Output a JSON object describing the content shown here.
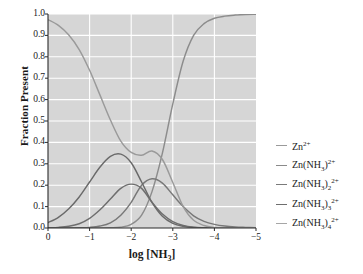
{
  "chart_data": {
    "type": "line",
    "title": "",
    "xlabel": "log [NH3]",
    "ylabel": "Fraction Present",
    "xlim": [
      0,
      -5
    ],
    "ylim": [
      0.0,
      1.0
    ],
    "grid": true,
    "legend_position": "right",
    "xticks": [
      "0",
      "−1",
      "−2",
      "−3",
      "−4",
      "−5"
    ],
    "xtick_values": [
      0,
      -1,
      -2,
      -3,
      -4,
      -5
    ],
    "yticks": [
      "0.0",
      "0.1",
      "0.2",
      "0.3",
      "0.4",
      "0.5",
      "0.6",
      "0.7",
      "0.8",
      "0.9",
      "1.0"
    ],
    "ytick_values": [
      0.0,
      0.1,
      0.2,
      0.3,
      0.4,
      0.5,
      0.6,
      0.7,
      0.8,
      0.9,
      1.0
    ],
    "x": [
      0.0,
      -0.25,
      -0.5,
      -0.75,
      -1.0,
      -1.25,
      -1.5,
      -1.75,
      -2.0,
      -2.25,
      -2.5,
      -2.75,
      -3.0,
      -3.25,
      -3.5,
      -3.75,
      -4.0,
      -4.25,
      -4.5,
      -4.75,
      -5.0
    ],
    "series": [
      {
        "name": "Zn2+",
        "label_html": "Zn<sup>2+</sup>",
        "color": "#8c8c8c",
        "values": [
          0.0,
          0.0,
          0.0,
          0.0,
          0.0,
          0.0,
          0.001,
          0.004,
          0.017,
          0.06,
          0.17,
          0.35,
          0.58,
          0.78,
          0.9,
          0.955,
          0.98,
          0.99,
          0.995,
          0.998,
          0.999
        ]
      },
      {
        "name": "Zn(NH3)2+",
        "label_html": "Zn(NH<sub>3</sub>)<sup>2+</sup>",
        "color": "#787878",
        "values": [
          0.0,
          0.0,
          0.0,
          0.001,
          0.003,
          0.009,
          0.024,
          0.06,
          0.12,
          0.2,
          0.23,
          0.21,
          0.155,
          0.1,
          0.057,
          0.031,
          0.017,
          0.009,
          0.005,
          0.003,
          0.0015
        ]
      },
      {
        "name": "Zn(NH3)2 2+",
        "label_html": "Zn(NH<sub>3</sub>)<sub>2</sub><sup>2+</sup>",
        "color": "#6e6e6e",
        "values": [
          0.001,
          0.003,
          0.008,
          0.02,
          0.045,
          0.085,
          0.135,
          0.185,
          0.205,
          0.185,
          0.12,
          0.065,
          0.03,
          0.012,
          0.004,
          0.0015,
          0.0005,
          0.0002,
          0.0001,
          0.0,
          0.0
        ]
      },
      {
        "name": "Zn(NH3)3 2+",
        "label_html": "Zn(NH<sub>3</sub>)<sub>3</sub><sup>2+</sup>",
        "color": "#6a6a6a",
        "values": [
          0.025,
          0.05,
          0.09,
          0.145,
          0.215,
          0.285,
          0.335,
          0.345,
          0.305,
          0.215,
          0.12,
          0.055,
          0.022,
          0.008,
          0.003,
          0.001,
          0.0003,
          0.0001,
          0.0,
          0.0,
          0.0
        ]
      },
      {
        "name": "Zn(NH3)4 2+",
        "label_html": "Zn(NH<sub>3</sub>)<sub>4</sub><sup>2+</sup>",
        "color": "#9a9a9a",
        "values": [
          0.974,
          0.947,
          0.902,
          0.834,
          0.737,
          0.621,
          0.505,
          0.406,
          0.353,
          0.34,
          0.36,
          0.32,
          0.213,
          0.1,
          0.036,
          0.0115,
          0.0025,
          0.0008,
          0.0002,
          0.0,
          0.0
        ]
      }
    ],
    "legend": [
      {
        "dash_color": "#9a9a9a"
      },
      {
        "dash_color": "#8a8a8a"
      },
      {
        "dash_color": "#7a7a7a"
      },
      {
        "dash_color": "#6e6e6e"
      },
      {
        "dash_color": "#a6a6a6"
      }
    ],
    "colors": {
      "plot_background": "#d6d6d6",
      "gridline": "#ffffff",
      "axis": "#2b2b2b",
      "text": "#1a1a1a"
    }
  }
}
